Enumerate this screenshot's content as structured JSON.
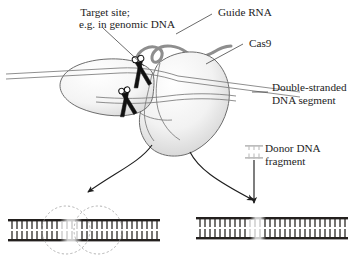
{
  "figure": {
    "background_color": "#ffffff",
    "text_color": "#1c1c1c"
  },
  "labels": {
    "target_site_line1": "Target site;",
    "target_site_line2": "e.g. in genomic DNA",
    "guide_rna": "Guide RNA",
    "cas9": "Cas9",
    "dna_segment_line1": "Double-stranded",
    "dna_segment_line2": "DNA segment",
    "donor_dna_line1": "Donor DNA",
    "donor_dna_line2": "fragment"
  },
  "colors": {
    "dna_dark": "#23201e",
    "dna_light": "#c4c4c4",
    "protein_outline": "#6d6d6d",
    "guide_rna": "#8e8e8e",
    "dashed_highlight": "#9a9a9a",
    "arrow": "#1f1f1f",
    "donor_fragment": "#bdbdbd"
  },
  "diagram": {
    "protein_name": "Cas9 nuclease",
    "lobes": [
      "recognition-lobe-left",
      "nuclease-lobe-right"
    ],
    "cut_sites": 2,
    "outcomes": [
      {
        "id": "nhej",
        "position": "bottom-left",
        "description": "repaired DNA with dashed highlight circles over the repair region",
        "highlight_circles": 2
      },
      {
        "id": "hdr",
        "position": "bottom-right",
        "description": "DNA with donor fragment integrated at the cut site",
        "insert_shown": true
      }
    ]
  },
  "dna_bottom_left": {
    "rung_count": 30,
    "light_segment_start_index": 11,
    "light_segment_end_index": 15
  },
  "dna_bottom_right": {
    "rung_count": 30,
    "light_segment_start_index": 12,
    "light_segment_end_index": 15
  },
  "donor_icon": {
    "rung_count": 3,
    "name": "donor-dna-fragment-icon"
  }
}
